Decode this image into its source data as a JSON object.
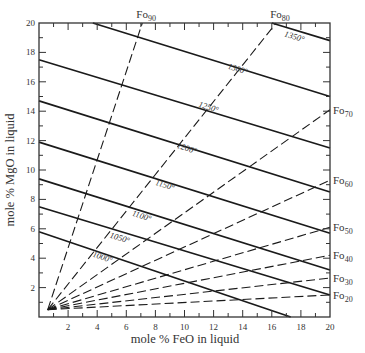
{
  "chart_data": {
    "type": "line",
    "title": "",
    "xlabel": "mole % FeO in liquid",
    "ylabel": "mole % MgO in liquid",
    "xlim": [
      0,
      20
    ],
    "ylim": [
      0,
      20
    ],
    "x_ticks": [
      2,
      4,
      6,
      8,
      10,
      12,
      14,
      16,
      18,
      20
    ],
    "y_ticks": [
      2,
      4,
      6,
      8,
      10,
      12,
      14,
      16,
      18,
      20
    ],
    "grid": false,
    "legend": null,
    "isotherms": [
      {
        "name": "1000°",
        "label": "1000°",
        "points": [
          [
            0,
            5.8
          ],
          [
            17.3,
            0
          ]
        ],
        "label_pos": [
          4.3,
          3.9
        ]
      },
      {
        "name": "1050°",
        "label": "1050°",
        "points": [
          [
            0,
            7.5
          ],
          [
            20,
            1.5
          ]
        ],
        "label_pos": [
          5.5,
          5.2
        ]
      },
      {
        "name": "1100°",
        "label": "1100°",
        "points": [
          [
            0,
            9.4
          ],
          [
            20,
            3.2
          ]
        ],
        "label_pos": [
          7.0,
          6.7
        ]
      },
      {
        "name": "1150°",
        "label": "1150°",
        "points": [
          [
            0,
            11.9
          ],
          [
            20,
            5.7
          ]
        ],
        "label_pos": [
          8.6,
          8.8
        ]
      },
      {
        "name": "1200°",
        "label": "1200°",
        "points": [
          [
            0,
            14.7
          ],
          [
            20,
            8.5
          ]
        ],
        "label_pos": [
          10.1,
          11.3
        ]
      },
      {
        "name": "1250°",
        "label": "1250°",
        "points": [
          [
            0,
            17.5
          ],
          [
            20,
            11.5
          ]
        ],
        "label_pos": [
          11.6,
          14.1
        ]
      },
      {
        "name": "1300°",
        "label": "1300°",
        "points": [
          [
            3.7,
            20
          ],
          [
            20,
            15.0
          ]
        ],
        "label_pos": [
          13.6,
          16.7
        ]
      },
      {
        "name": "1350°",
        "label": "1350°",
        "points": [
          [
            16.0,
            20
          ],
          [
            20,
            18.8
          ]
        ],
        "label_pos": [
          17.5,
          18.9
        ]
      }
    ],
    "forsterite_lines": [
      {
        "name": "Fo90",
        "label": "Fo",
        "sub": "90",
        "points": [
          [
            0.6,
            0.5
          ],
          [
            7.1,
            20
          ]
        ]
      },
      {
        "name": "Fo80",
        "label": "Fo",
        "sub": "80",
        "points": [
          [
            0.6,
            0.5
          ],
          [
            16.3,
            20
          ]
        ]
      },
      {
        "name": "Fo70",
        "label": "Fo",
        "sub": "70",
        "points": [
          [
            0.6,
            0.5
          ],
          [
            20,
            14.1
          ]
        ]
      },
      {
        "name": "Fo60",
        "label": "Fo",
        "sub": "60",
        "points": [
          [
            0.6,
            0.5
          ],
          [
            20,
            9.3
          ]
        ]
      },
      {
        "name": "Fo50",
        "label": "Fo",
        "sub": "50",
        "points": [
          [
            0.6,
            0.5
          ],
          [
            20,
            6.1
          ]
        ]
      },
      {
        "name": "Fo40",
        "label": "Fo",
        "sub": "40",
        "points": [
          [
            0.6,
            0.5
          ],
          [
            20,
            4.2
          ]
        ]
      },
      {
        "name": "Fo30",
        "label": "Fo",
        "sub": "30",
        "points": [
          [
            0.6,
            0.5
          ],
          [
            20,
            2.65
          ]
        ]
      },
      {
        "name": "Fo20",
        "label": "Fo",
        "sub": "20",
        "points": [
          [
            0.6,
            0.5
          ],
          [
            20,
            1.5
          ]
        ]
      }
    ]
  },
  "axes": {
    "xlabel": "mole % FeO in liquid",
    "ylabel": "mole % MgO in liquid"
  }
}
